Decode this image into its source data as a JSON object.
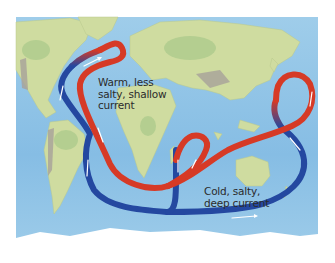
{
  "diagram": {
    "labels": {
      "warm_line1": "Warm, less",
      "warm_line2": "salty, shallow",
      "warm_line3": "current",
      "cold_line1": "Cold, salty,",
      "cold_line2": "deep current"
    },
    "colors": {
      "ocean": "#8ec3e6",
      "ocean_deep": "#6fb0de",
      "land": "#cfdca0",
      "land_green": "#a9c98a",
      "mountain": "#a8a29a",
      "ice": "#ffffff",
      "warm_current": "#d63a26",
      "cold_current": "#2448a0",
      "arrow": "#ffffff"
    },
    "legend": [
      {
        "name": "warm-current",
        "description": "Warm, less salty, shallow current",
        "color": "#d63a26"
      },
      {
        "name": "cold-current",
        "description": "Cold, salty, deep current",
        "color": "#2448a0"
      }
    ]
  }
}
